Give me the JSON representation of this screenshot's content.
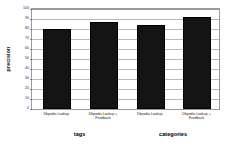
{
  "chart_data": {
    "type": "bar",
    "title": "",
    "xlabel": "",
    "ylabel": "precision",
    "ylim": [
      0,
      100
    ],
    "ytick_values": [
      0,
      10,
      20,
      30,
      40,
      50,
      60,
      70,
      80,
      90,
      100
    ],
    "ytick_labels": [
      "0",
      "10",
      "20",
      "30",
      "40",
      "50",
      "60",
      "70",
      "80",
      "90",
      "100"
    ],
    "grid": true,
    "legend": "none",
    "bar_color": "#141414",
    "categories": [
      "Dbpedia Lookup",
      "Dbpedia Lookup + Feedback",
      "Dbpedia Lookup",
      "Dbpedia Lookup + Feedback"
    ],
    "values": [
      80,
      87,
      84,
      92
    ],
    "groups": [
      {
        "label": "tags",
        "categories": [
          "Dbpedia Lookup",
          "Dbpedia Lookup + Feedback"
        ],
        "values": [
          80,
          87
        ]
      },
      {
        "label": "categories",
        "categories": [
          "Dbpedia Lookup",
          "Dbpedia Lookup + Feedback"
        ],
        "values": [
          84,
          92
        ]
      }
    ]
  },
  "axis": {
    "y_title": "precision"
  },
  "groups": {
    "tags": "tags",
    "categories": "categories"
  },
  "bars": [
    {
      "label_line1": "Dbpedia Lookup",
      "label_line2": "",
      "value": 80
    },
    {
      "label_line1": "Dbpedia Lookup +",
      "label_line2": "Feedback",
      "value": 87
    },
    {
      "label_line1": "Dbpedia Lookup",
      "label_line2": "",
      "value": 84
    },
    {
      "label_line1": "Dbpedia Lookup +",
      "label_line2": "Feedback",
      "value": 92
    }
  ],
  "yticks": [
    {
      "label": "100"
    },
    {
      "label": "90"
    },
    {
      "label": "80"
    },
    {
      "label": "70"
    },
    {
      "label": "60"
    },
    {
      "label": "50"
    },
    {
      "label": "40"
    },
    {
      "label": "30"
    },
    {
      "label": "20"
    },
    {
      "label": "10"
    },
    {
      "label": "0"
    }
  ]
}
